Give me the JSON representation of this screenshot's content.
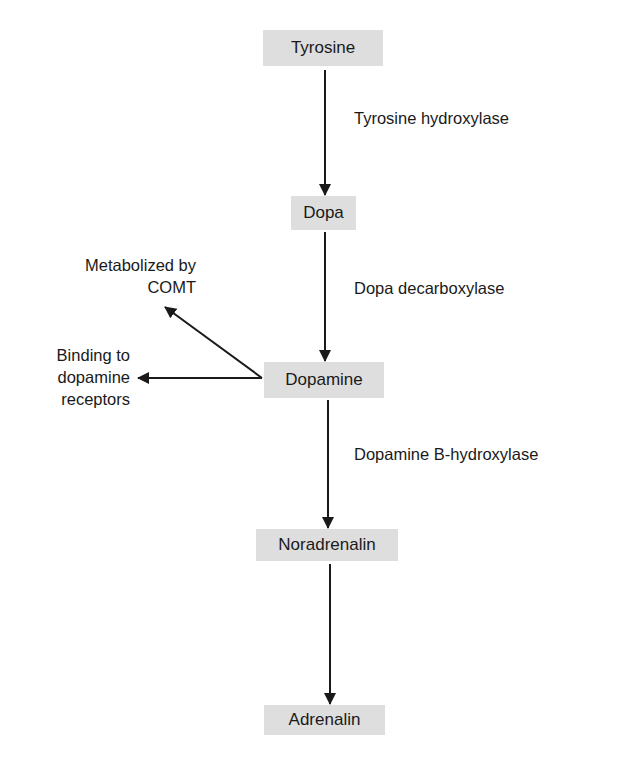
{
  "nodes": {
    "tyrosine": "Tyrosine",
    "dopa": "Dopa",
    "dopamine": "Dopamine",
    "noradrenalin": "Noradrenalin",
    "adrenalin": "Adrenalin"
  },
  "enzymes": {
    "tyrosine_hydroxylase": "Tyrosine hydroxylase",
    "dopa_decarboxylase": "Dopa decarboxylase",
    "dopamine_b_hydroxylase": "Dopamine B-hydroxylase"
  },
  "side_pathways": {
    "comt_line1": "Metabolized by",
    "comt_line2": "COMT",
    "binding_line1": "Binding to",
    "binding_line2": "dopamine",
    "binding_line3": "receptors"
  },
  "colors": {
    "box_fill": "#dedede",
    "ink": "#1a1a1a"
  }
}
